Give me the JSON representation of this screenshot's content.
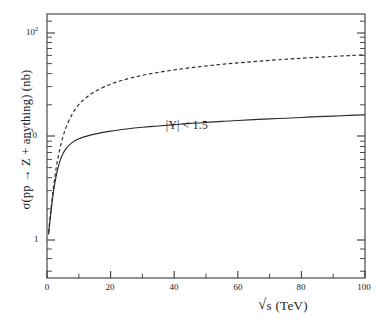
{
  "chart_data": {
    "type": "line",
    "title": "",
    "subtitle": "",
    "xlabel": "√s  (TeV)",
    "ylabel": "σ(pp → Z + anything)  (nb)",
    "xlim": [
      0,
      100
    ],
    "ylim": [
      0.38,
      180
    ],
    "yscale": "log",
    "xscale": "linear",
    "grid": false,
    "legend": null,
    "xticks": [
      0,
      20,
      40,
      60,
      80,
      100
    ],
    "xtick_labels": [
      "0",
      "20",
      "40",
      "60",
      "80",
      "100"
    ],
    "xminor_step": 10,
    "yticks": [
      1,
      10,
      100
    ],
    "ytick_labels": [
      "1",
      "10",
      "10²"
    ],
    "annotations": [
      {
        "text": "|Y| < 1.5",
        "x": 38,
        "y": 13.5
      }
    ],
    "series": [
      {
        "name": "total cross section",
        "style": "dashed",
        "color": "#2b2b2b",
        "x": [
          0.5,
          1,
          2,
          3,
          4,
          5,
          6,
          8,
          10,
          12,
          15,
          20,
          25,
          30,
          35,
          40,
          45,
          50,
          55,
          60,
          65,
          70,
          75,
          80,
          85,
          90,
          95,
          100
        ],
        "y": [
          1.1,
          1.6,
          3.1,
          5.2,
          7.6,
          10.2,
          12.8,
          17.6,
          21.7,
          25.1,
          29.4,
          35.0,
          39.4,
          43.0,
          46.1,
          48.8,
          51.3,
          53.5,
          55.6,
          57.5,
          59.3,
          61.0,
          62.6,
          64.1,
          65.5,
          66.9,
          68.2,
          69.5
        ]
      },
      {
        "name": "|Y| < 1.5 cross section",
        "style": "solid",
        "color": "#2b2b2b",
        "x": [
          0.5,
          1,
          2,
          3,
          4,
          5,
          6,
          8,
          10,
          12,
          15,
          20,
          25,
          30,
          35,
          40,
          45,
          50,
          55,
          60,
          65,
          70,
          75,
          80,
          85,
          90,
          95,
          100
        ],
        "y": [
          1.05,
          1.5,
          2.8,
          4.3,
          5.7,
          6.9,
          7.8,
          9.0,
          9.8,
          10.3,
          10.9,
          11.7,
          12.3,
          12.8,
          13.2,
          13.6,
          14.0,
          14.3,
          14.7,
          15.0,
          15.3,
          15.6,
          15.8,
          16.1,
          16.4,
          16.6,
          16.9,
          17.1
        ]
      }
    ]
  },
  "axes": {
    "y_tick_top_mantissa": "10",
    "y_tick_top_exponent": "2",
    "y_tick_mid": "10",
    "y_tick_bottom": "1",
    "x_tick_0": "0",
    "x_tick_20": "20",
    "x_tick_40": "40",
    "x_tick_60": "60",
    "x_tick_80": "80",
    "x_tick_100": "100",
    "x_title_radical": "√",
    "x_title_rest": "s  (TeV)",
    "y_title": "σ(pp → Z + anything)  (nb)"
  },
  "annotation": {
    "cut_label": "|Y| < 1.5"
  },
  "colors": {
    "frame": "#3a3a3a",
    "curve": "#2b2b2b",
    "background": "#ffffff",
    "text": "#1a1a1a"
  }
}
